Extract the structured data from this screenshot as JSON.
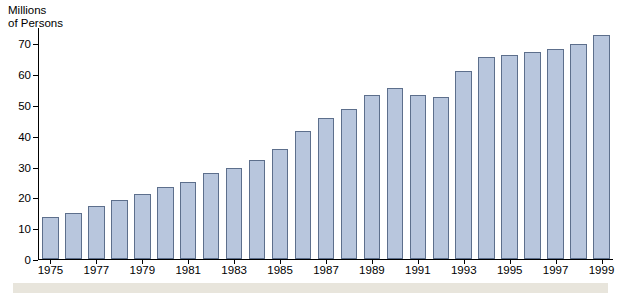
{
  "chart_data": {
    "type": "bar",
    "title": "",
    "ylabel": "Millions\nof Persons",
    "xlabel": "",
    "ylim": [
      0,
      75
    ],
    "yticks": [
      0,
      10,
      20,
      30,
      40,
      50,
      60,
      70
    ],
    "ytick_labels": [
      "0",
      "10",
      "20",
      "30",
      "40",
      "50",
      "60",
      "70"
    ],
    "grid": false,
    "legend": null,
    "xtick_labels": [
      "1975",
      "1977",
      "1979",
      "1981",
      "1983",
      "1985",
      "1987",
      "1989",
      "1991",
      "1993",
      "1995",
      "1997",
      "1999"
    ],
    "categories": [
      "1975",
      "1976",
      "1977",
      "1978",
      "1979",
      "1980",
      "1981",
      "1982",
      "1983",
      "1984",
      "1985",
      "1986",
      "1987",
      "1988",
      "1989",
      "1990",
      "1991",
      "1992",
      "1993",
      "1994",
      "1995",
      "1996",
      "1997",
      "1998",
      "1999"
    ],
    "values": [
      13.5,
      15.1,
      17.3,
      19.3,
      21.2,
      23.5,
      24.9,
      27.8,
      29.4,
      32.1,
      35.7,
      41.5,
      45.7,
      48.6,
      53.3,
      55.5,
      53.3,
      52.5,
      61.0,
      65.5,
      66.4,
      67.3,
      68.3,
      69.8,
      72.6
    ],
    "bar_color": "#b8c6dd",
    "bar_edge_color": "#5d6f8c",
    "axis_color": "#000000",
    "background_color": "#ffffff",
    "footer_band_color": "#e8e5dc"
  }
}
